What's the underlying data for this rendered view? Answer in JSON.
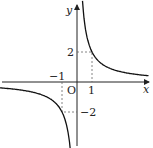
{
  "diagram": {
    "type": "function-graph",
    "function": "y = 2/x",
    "axes": {
      "x_label": "x",
      "y_label": "y",
      "origin_label": "O"
    },
    "ticks": {
      "x_pos": "1",
      "x_neg": "−1",
      "y_pos": "2",
      "y_neg": "−2"
    },
    "marked_points": [
      {
        "x": 1,
        "y": 2
      },
      {
        "x": -1,
        "y": -2
      }
    ],
    "colors": {
      "curve": "#111111",
      "axis": "#222222",
      "dashed": "#666666"
    }
  }
}
